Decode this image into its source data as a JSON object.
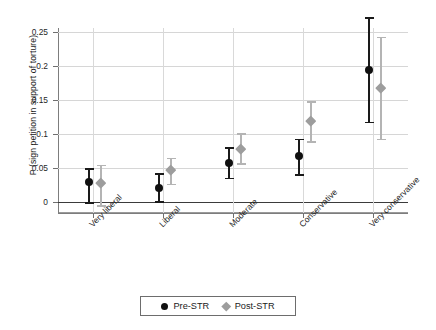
{
  "chart_data": {
    "type": "scatter",
    "title": "",
    "xlabel": "",
    "ylabel": "P (sign petition in support of torture)",
    "categories": [
      "Very liberal",
      "Liberal",
      "Moderate",
      "Conservative",
      "Very conservative"
    ],
    "yticks": [
      "0",
      "0.05",
      "0.1",
      "0.15",
      "0.2",
      "0.25"
    ],
    "ytick_values": [
      0,
      0.05,
      0.1,
      0.15,
      0.2,
      0.25
    ],
    "ylim": [
      -0.02,
      0.275
    ],
    "grid": true,
    "legend_position": "bottom-center",
    "zero_reference_line": 0,
    "series": [
      {
        "name": "Pre-STR",
        "marker": "circle",
        "color": "#101010",
        "values": [
          0.029,
          0.021,
          0.057,
          0.068,
          0.194
        ],
        "ci_low": [
          0.0,
          0.001,
          0.036,
          0.041,
          0.118
        ],
        "ci_high": [
          0.05,
          0.042,
          0.081,
          0.093,
          0.272
        ]
      },
      {
        "name": "Post-STR",
        "marker": "diamond",
        "color": "#9d9d9d",
        "values": [
          0.028,
          0.048,
          0.079,
          0.119,
          0.168
        ],
        "ci_low": [
          -0.005,
          0.027,
          0.057,
          0.089,
          0.093
        ],
        "ci_high": [
          0.055,
          0.065,
          0.101,
          0.148,
          0.243
        ]
      }
    ]
  },
  "legend": {
    "items": [
      {
        "label": "Pre-STR",
        "icon": "circle-marker-icon"
      },
      {
        "label": "Post-STR",
        "icon": "diamond-marker-icon"
      }
    ]
  }
}
